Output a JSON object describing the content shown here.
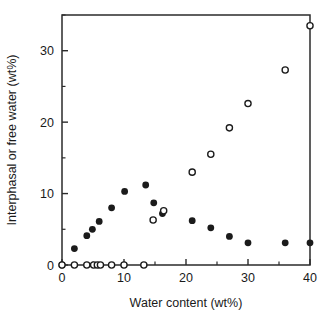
{
  "chart_data": {
    "type": "scatter",
    "title": "",
    "xlabel": "Water content (wt%)",
    "ylabel": "Interphasal or free water (wt%)",
    "xlim": [
      0,
      40
    ],
    "ylim": [
      0,
      35
    ],
    "grid": false,
    "legend": "none",
    "x_ticks_major": [
      0,
      10,
      20,
      30,
      40
    ],
    "x_tick_labels": [
      "0",
      "10",
      "20",
      "30",
      "40"
    ],
    "x_ticks_minor": [
      5,
      15,
      25,
      35
    ],
    "y_ticks_major": [
      0,
      10,
      20,
      30
    ],
    "y_tick_labels": [
      "0",
      "10",
      "20",
      "30"
    ],
    "y_ticks_minor": [
      5,
      15,
      25,
      35
    ],
    "series": [
      {
        "name": "Interphasal water",
        "marker": "filled-circle",
        "color": "#1b1b1b",
        "points": [
          {
            "x": 0.0,
            "y": 0.0
          },
          {
            "x": 2.0,
            "y": 2.3
          },
          {
            "x": 4.0,
            "y": 4.1
          },
          {
            "x": 4.9,
            "y": 5.0
          },
          {
            "x": 6.0,
            "y": 6.1
          },
          {
            "x": 8.0,
            "y": 8.0
          },
          {
            "x": 10.1,
            "y": 10.3
          },
          {
            "x": 13.5,
            "y": 11.2
          },
          {
            "x": 14.8,
            "y": 8.7
          },
          {
            "x": 16.2,
            "y": 7.2
          },
          {
            "x": 21.0,
            "y": 6.2
          },
          {
            "x": 24.0,
            "y": 5.2
          },
          {
            "x": 27.0,
            "y": 4.0
          },
          {
            "x": 30.0,
            "y": 3.1
          },
          {
            "x": 36.0,
            "y": 3.1
          },
          {
            "x": 40.0,
            "y": 3.1
          }
        ]
      },
      {
        "name": "Free water",
        "marker": "open-circle",
        "color": "#1b1b1b",
        "points": [
          {
            "x": 0.0,
            "y": 0.0
          },
          {
            "x": 2.0,
            "y": 0.0
          },
          {
            "x": 4.0,
            "y": 0.0
          },
          {
            "x": 5.1,
            "y": 0.0
          },
          {
            "x": 5.7,
            "y": 0.0
          },
          {
            "x": 6.2,
            "y": 0.0
          },
          {
            "x": 8.0,
            "y": 0.0
          },
          {
            "x": 10.0,
            "y": 0.0
          },
          {
            "x": 13.2,
            "y": 0.0
          },
          {
            "x": 14.7,
            "y": 6.3
          },
          {
            "x": 16.4,
            "y": 7.6
          },
          {
            "x": 21.0,
            "y": 13.0
          },
          {
            "x": 24.0,
            "y": 15.5
          },
          {
            "x": 27.0,
            "y": 19.2
          },
          {
            "x": 30.0,
            "y": 22.6
          },
          {
            "x": 36.0,
            "y": 27.3
          },
          {
            "x": 40.0,
            "y": 33.5
          }
        ]
      }
    ]
  },
  "plot_geometry": {
    "left_px": 62,
    "right_px": 310,
    "bottom_px": 265,
    "top_px": 15
  }
}
